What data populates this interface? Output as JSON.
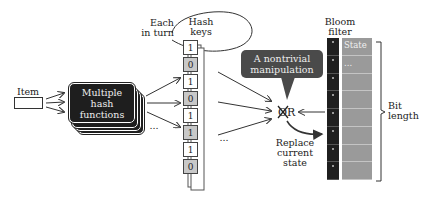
{
  "diagram": {
    "item": {
      "label": "Item"
    },
    "hash_functions": {
      "label_line1": "Multiple",
      "label_line2": "hash",
      "label_line3": "functions",
      "ellipsis": "..."
    },
    "each_in_turn": {
      "line1": "Each",
      "line2": "in turn"
    },
    "hash_keys": {
      "title_line1": "Hash",
      "title_line2": "keys",
      "bits": [
        "1",
        "0",
        "1",
        "0",
        "1",
        "1",
        "1",
        "0"
      ],
      "shading": [
        "light",
        "grey",
        "light",
        "grey",
        "light",
        "grey",
        "light",
        "grey"
      ],
      "ellipsis": "..."
    },
    "callout": {
      "line1": "A nontrivial",
      "line2": "manipulation"
    },
    "operator": {
      "symbol": "XOR"
    },
    "replace": {
      "line1": "Replace",
      "line2": "current",
      "line3": "state"
    },
    "bloom_filter": {
      "title_line1": "Bloom",
      "title_line2": "filter",
      "rows": [
        "State",
        "...",
        "",
        "",
        "",
        "",
        "",
        ""
      ]
    },
    "bit_length": {
      "line1": "Bit",
      "line2": "length"
    },
    "colors": {
      "hash_box": "#1e1e1e",
      "callout": "#4a4a4a",
      "key_grey": "#c8c8c8",
      "bloom_bits": "#1f1f1f",
      "bloom_state": "#9a9a9a"
    }
  }
}
